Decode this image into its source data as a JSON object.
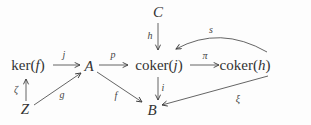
{
  "diagram": {
    "background": "#fdfdfd",
    "ink": "#3d3d3d",
    "nodes": {
      "C": {
        "label": "C"
      },
      "kerf": {
        "prefix": "ker(",
        "var": "f",
        "suffix": ")"
      },
      "A": {
        "label": "A"
      },
      "cokerj": {
        "prefix": "coker(",
        "var": "j",
        "suffix": ")"
      },
      "cokerh": {
        "prefix": "coker(",
        "var": "h",
        "suffix": ")"
      },
      "Z": {
        "label": "Z"
      },
      "B": {
        "label": "B"
      }
    },
    "arrows": {
      "j": {
        "label": "j",
        "from": "ker(f)",
        "to": "A"
      },
      "p": {
        "label": "p",
        "from": "A",
        "to": "coker(j)"
      },
      "pi": {
        "label": "π",
        "from": "coker(j)",
        "to": "coker(h)"
      },
      "h": {
        "label": "h",
        "from": "C",
        "to": "coker(j)"
      },
      "s": {
        "label": "s",
        "from": "coker(h)",
        "to": "coker(j)",
        "style": "curved"
      },
      "zeta": {
        "label": "ζ",
        "from": "Z",
        "to": "ker(f)"
      },
      "g": {
        "label": "g",
        "from": "Z",
        "to": "A"
      },
      "f": {
        "label": "f",
        "from": "A",
        "to": "B"
      },
      "i": {
        "label": "i",
        "from": "coker(j)",
        "to": "B"
      },
      "xi": {
        "label": "ξ",
        "from": "coker(h)",
        "to": "B"
      }
    }
  }
}
